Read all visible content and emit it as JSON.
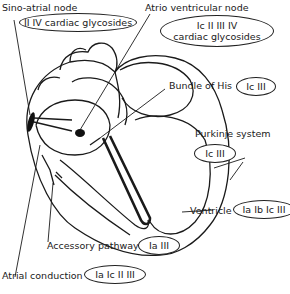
{
  "labels": {
    "sa_node": {
      "name": "Sino-atrial node",
      "drugs": "II IV cardiac glycosides"
    },
    "av_node": {
      "name": "Atrio ventricular node",
      "drugs_line1": "Ic II III IV",
      "drugs_line2": "cardiac glycosides"
    },
    "bundle_his": {
      "name": "Bundle of His",
      "drugs": "Ic III"
    },
    "purkinje": {
      "name": "Purkinje system",
      "drugs": "Ic III"
    },
    "ventricle": {
      "name": "Ventricle",
      "drugs": "Ia Ib Ic III"
    },
    "accessory": {
      "name": "Accessory pathway",
      "drugs": "Ia III"
    },
    "atrial": {
      "name": "Atrial conduction",
      "drugs": "Ia Ic II III"
    }
  }
}
